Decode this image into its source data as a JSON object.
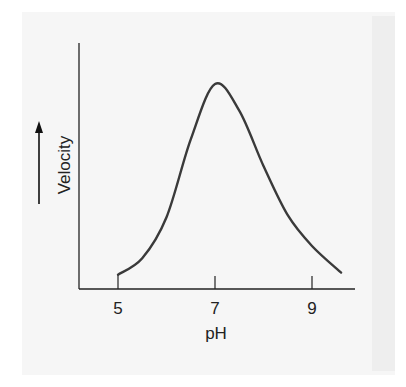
{
  "chart_data": {
    "type": "line",
    "title": "",
    "xlabel": "pH",
    "ylabel": "Velocity",
    "ylabel_arrow": "up",
    "x_ticks": [
      5,
      7,
      9
    ],
    "x_tick_labels": [
      "5",
      "7",
      "9"
    ],
    "xlim": [
      4.2,
      9.8
    ],
    "ylim": [
      0,
      110
    ],
    "y_ticks": [],
    "grid": false,
    "legend": null,
    "series": [
      {
        "name": "Enzyme velocity",
        "x": [
          5.0,
          5.5,
          6.0,
          6.5,
          7.0,
          7.5,
          8.0,
          8.5,
          9.0,
          9.6
        ],
        "values": [
          7,
          15,
          35,
          73,
          100,
          87,
          60,
          36,
          21,
          8
        ]
      }
    ],
    "annotations": [
      "Optimum at pH 7"
    ]
  },
  "axes": {
    "x_label": "pH",
    "y_label": "Velocity",
    "ticks": [
      "5",
      "7",
      "9"
    ]
  },
  "colors": {
    "line": "#3a3a3a",
    "axis": "#222222",
    "panel": "#f6f6f6"
  }
}
